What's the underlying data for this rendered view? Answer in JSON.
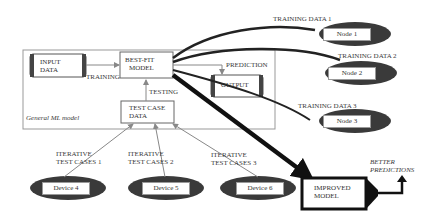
{
  "frame": {
    "label": "General ML model"
  },
  "boxes": {
    "input_data": {
      "line1": "INPUT",
      "line2": "DATA"
    },
    "best_fit_model": {
      "line1": "BEST-FIT",
      "line2": "MODEL"
    },
    "output": {
      "line1": "OUTPUT"
    },
    "test_case_data": {
      "line1": "TEST CASE",
      "line2": "DATA"
    },
    "improved_model": {
      "line1": "IMPROVED",
      "line2": "MODEL"
    }
  },
  "edge_labels": {
    "training": "TRAINING",
    "testing": "TESTING",
    "prediction": "PREDICTION",
    "training_data_1": "TRAINING DATA 1",
    "training_data_2": "TRAINING DATA 2",
    "training_data_3": "TRAINING DATA 3",
    "iterative_1_line1": "ITERATIVE",
    "iterative_1_line2": "TEST CASES 1",
    "iterative_2_line1": "ITERATIVE",
    "iterative_2_line2": "TEST CASES 2",
    "iterative_3_line1": "ITERATIVE",
    "iterative_3_line2": "TEST CASES 3",
    "better_line1": "BETTER",
    "better_line2": "PREDICTIONS"
  },
  "nodes": [
    {
      "label": "Node 1"
    },
    {
      "label": "Node 2"
    },
    {
      "label": "Node 3"
    }
  ],
  "devices": [
    {
      "label": "Device 4"
    },
    {
      "label": "Device 5"
    },
    {
      "label": "Device 6"
    }
  ],
  "colors": {
    "ellipse_fill": "#3a3a3a",
    "line": "#222222",
    "thin_line": "#888888",
    "frame": "#999999"
  }
}
